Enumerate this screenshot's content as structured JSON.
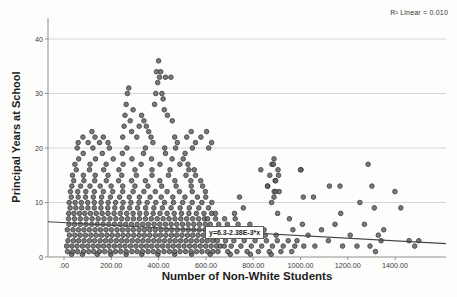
{
  "figure": {
    "r2_annotation": "R² Linear = 0.010",
    "colors": {
      "point_fill": "#686868",
      "point_edge": "#2e2e2e",
      "gridline": "#cbcbcb",
      "axis": "#8f8f8f",
      "regression_line": "#454545",
      "background": "#fdfdfb"
    }
  },
  "chart_data": {
    "type": "scatter",
    "title": "",
    "xlabel": "Number of Non-White Students",
    "ylabel": "Principal Years at School",
    "xlim": [
      -65,
      1615
    ],
    "ylim": [
      0,
      43.8
    ],
    "x_ticks": [
      0,
      200,
      400,
      600,
      800,
      1000,
      1200,
      1400
    ],
    "x_tick_labels": [
      ".00",
      "200.00",
      "400.00",
      "600.00",
      "800.00",
      "1000.00",
      "1200.00",
      "1400.00"
    ],
    "y_ticks": [
      0,
      10,
      20,
      30,
      40
    ],
    "y_tick_labels": [
      "0",
      "10",
      "20",
      "30",
      "40"
    ],
    "grid": "horizontal",
    "legend": "none",
    "regression": {
      "equation": "y=6.3-2.38E-3*x",
      "intercept": 6.3,
      "slope": -0.00238,
      "r2": 0.01
    },
    "series": {
      "rows": [
        {
          "y": 0.5,
          "xs": [
            32,
            78,
            141,
            198,
            263,
            329,
            397,
            468,
            539,
            618,
            703,
            788,
            876
          ]
        },
        {
          "y": 1,
          "xs": [
            15,
            37,
            58,
            83,
            105,
            126,
            150,
            172,
            195,
            218,
            240,
            263,
            287,
            309,
            332,
            355,
            377,
            399,
            423,
            446,
            468,
            491,
            514,
            537,
            560,
            583,
            607,
            630,
            651,
            692,
            731,
            774,
            822,
            868,
            917,
            963
          ]
        },
        {
          "y": 2,
          "xs": [
            11,
            33,
            55,
            78,
            100,
            123,
            145,
            167,
            190,
            213,
            236,
            258,
            281,
            304,
            327,
            349,
            371,
            394,
            417,
            440,
            462,
            485,
            508,
            531,
            553,
            576,
            599,
            622,
            645,
            661,
            678,
            707,
            748,
            792,
            836,
            881,
            927,
            976,
            1014
          ]
        },
        {
          "y": 3,
          "xs": [
            17,
            40,
            62,
            85,
            108,
            130,
            153,
            176,
            198,
            221,
            244,
            266,
            289,
            312,
            334,
            357,
            380,
            402,
            425,
            448,
            470,
            493,
            516,
            538,
            561,
            584,
            606,
            629,
            648,
            683,
            718,
            762,
            808,
            856,
            902,
            948
          ]
        },
        {
          "y": 4,
          "xs": [
            23,
            46,
            68,
            91,
            114,
            136,
            159,
            182,
            204,
            227,
            250,
            272,
            295,
            318,
            340,
            363,
            386,
            408,
            431,
            454,
            476,
            499,
            522,
            544,
            567,
            590,
            612,
            635,
            672,
            712,
            757,
            803,
            851,
            897
          ]
        },
        {
          "y": 5,
          "xs": [
            14,
            38,
            61,
            84,
            107,
            131,
            154,
            177,
            200,
            224,
            247,
            270,
            293,
            317,
            340,
            363,
            386,
            410,
            433,
            456,
            479,
            503,
            526,
            549,
            572,
            596,
            619,
            634,
            667,
            706,
            751,
            796,
            846
          ]
        },
        {
          "y": 6,
          "xs": [
            21,
            45,
            69,
            93,
            117,
            141,
            165,
            189,
            213,
            237,
            261,
            285,
            309,
            333,
            357,
            381,
            405,
            429,
            453,
            477,
            501,
            525,
            549,
            573,
            597,
            618,
            654,
            691,
            736,
            786
          ]
        },
        {
          "y": 7,
          "xs": [
            19,
            44,
            69,
            94,
            119,
            144,
            169,
            194,
            219,
            244,
            269,
            294,
            319,
            344,
            369,
            394,
            419,
            444,
            469,
            494,
            519,
            544,
            569,
            594,
            607,
            641,
            679,
            724
          ]
        },
        {
          "y": 8,
          "xs": [
            20,
            42,
            65,
            88,
            112,
            136,
            161,
            186,
            212,
            238,
            265,
            292,
            320,
            348,
            377,
            406,
            436,
            466,
            497,
            528,
            560,
            592,
            624,
            640,
            721,
            903
          ]
        },
        {
          "y": 9,
          "xs": [
            26,
            50,
            75,
            101,
            128,
            156,
            185,
            215,
            246,
            278,
            311,
            345,
            380,
            416,
            453,
            491,
            530,
            570,
            611,
            758
          ]
        },
        {
          "y": 10,
          "xs": [
            22,
            47,
            73,
            100,
            128,
            157,
            187,
            218,
            250,
            283,
            317,
            352,
            388,
            425,
            463,
            502,
            542,
            583,
            625,
            878
          ]
        },
        {
          "y": 11,
          "xs": [
            31,
            60,
            91,
            124,
            159,
            196,
            235,
            276,
            319,
            364,
            411,
            460,
            511,
            564,
            599,
            742
          ]
        },
        {
          "y": 12,
          "xs": [
            27,
            58,
            92,
            128,
            166,
            206,
            248,
            292,
            338,
            386,
            436,
            488,
            542,
            598,
            889
          ]
        },
        {
          "y": 13,
          "xs": [
            33,
            70,
            110,
            153,
            199,
            248,
            300,
            355,
            413,
            474,
            538,
            586,
            861,
            1167
          ]
        },
        {
          "y": 14,
          "xs": [
            41,
            84,
            130,
            179,
            231,
            286,
            344,
            405,
            469,
            536,
            578,
            893,
            895
          ]
        },
        {
          "y": 15,
          "xs": [
            36,
            82,
            132,
            186,
            244,
            306,
            372,
            442,
            516,
            556,
            870,
            907
          ]
        },
        {
          "y": 16,
          "xs": [
            52,
            108,
            168,
            232,
            300,
            372,
            448,
            528,
            551,
            832,
            905,
            1002
          ]
        },
        {
          "y": 17,
          "xs": [
            46,
            110,
            178,
            250,
            326,
            406,
            490,
            524,
            879,
            886,
            1286
          ]
        },
        {
          "y": 18,
          "xs": [
            62,
            133,
            208,
            287,
            370,
            457,
            504,
            888
          ]
        },
        {
          "y": 19,
          "xs": [
            81,
            162,
            247,
            336,
            429,
            512
          ]
        },
        {
          "y": 20,
          "xs": [
            56,
            122,
            192,
            266,
            344,
            426,
            472,
            543,
            612
          ]
        }
      ],
      "points": [
        [
          60,
          21
        ],
        [
          80,
          22
        ],
        [
          102,
          21
        ],
        [
          118,
          23
        ],
        [
          131,
          22
        ],
        [
          150,
          21
        ],
        [
          166,
          22
        ],
        [
          186,
          21
        ],
        [
          248,
          22
        ],
        [
          254,
          24
        ],
        [
          258,
          26
        ],
        [
          263,
          28
        ],
        [
          268,
          30
        ],
        [
          274,
          31
        ],
        [
          280,
          25
        ],
        [
          286,
          23
        ],
        [
          292,
          27
        ],
        [
          308,
          22
        ],
        [
          318,
          24
        ],
        [
          328,
          26
        ],
        [
          338,
          25
        ],
        [
          348,
          24
        ],
        [
          358,
          23
        ],
        [
          368,
          22
        ],
        [
          376,
          21
        ],
        [
          383,
          28
        ],
        [
          388,
          30
        ],
        [
          391,
          34
        ],
        [
          396,
          32
        ],
        [
          400,
          36
        ],
        [
          404,
          33
        ],
        [
          409,
          34
        ],
        [
          414,
          30
        ],
        [
          419,
          29
        ],
        [
          424,
          27
        ],
        [
          429,
          33
        ],
        [
          437,
          26
        ],
        [
          452,
          33
        ],
        [
          458,
          25
        ],
        [
          468,
          22
        ],
        [
          479,
          21
        ],
        [
          519,
          22
        ],
        [
          538,
          23
        ],
        [
          556,
          21
        ],
        [
          579,
          22
        ],
        [
          603,
          23
        ],
        [
          624,
          21
        ],
        [
          895,
          12
        ],
        [
          910,
          12
        ],
        [
          888,
          11
        ],
        [
          861,
          13
        ],
        [
          1000,
          16
        ],
        [
          1012,
          11
        ],
        [
          1055,
          11
        ],
        [
          1122,
          13
        ],
        [
          1170,
          8
        ],
        [
          1251,
          10
        ],
        [
          1302,
          13
        ],
        [
          1312,
          9
        ],
        [
          1399,
          12
        ],
        [
          1424,
          9
        ],
        [
          953,
          7
        ],
        [
          968,
          5
        ],
        [
          985,
          3
        ],
        [
          1008,
          6
        ],
        [
          1032,
          4
        ],
        [
          1061,
          2
        ],
        [
          1089,
          5
        ],
        [
          1118,
          3
        ],
        [
          1146,
          6
        ],
        [
          1178,
          2
        ],
        [
          1210,
          4
        ],
        [
          1239,
          2
        ],
        [
          1270,
          6
        ],
        [
          1294,
          2
        ],
        [
          1317,
          1
        ],
        [
          1329,
          4
        ],
        [
          1341,
          3
        ],
        [
          1352,
          5
        ],
        [
          1459,
          3
        ],
        [
          1483,
          2
        ],
        [
          1500,
          3
        ]
      ]
    }
  }
}
